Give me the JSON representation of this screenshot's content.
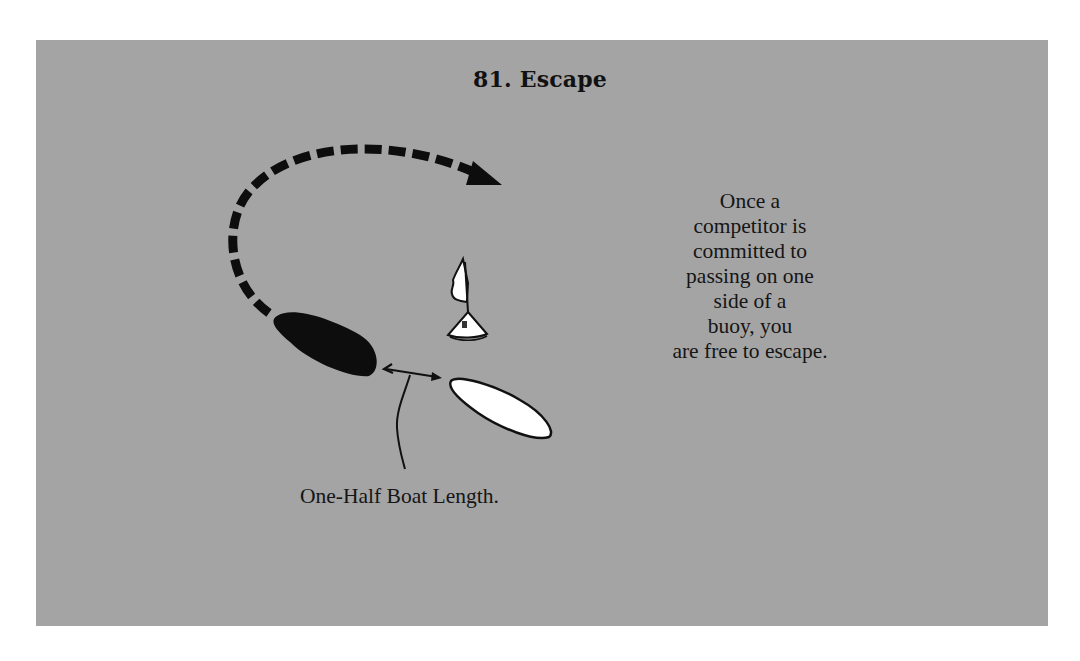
{
  "page": {
    "background_color": "#ffffff",
    "card_color": "#a4a4a4"
  },
  "title": "81.  Escape",
  "description": {
    "lines": [
      "Once a",
      "competitor is",
      "committed to",
      "passing on one",
      "side of a",
      "buoy, you",
      "are free to escape."
    ]
  },
  "diagram": {
    "caption": "One-Half Boat Length.",
    "elements": {
      "dark_boat": {
        "fill": "#0d0d0d"
      },
      "white_boat": {
        "fill": "#ffffff",
        "stroke": "#111111"
      },
      "buoy": {
        "fill": "#ffffff",
        "stroke": "#111111"
      },
      "escape_path": {
        "style": "dashed",
        "color": "#0d0d0d"
      },
      "distance_arrow": {
        "style": "double-headed",
        "color": "#111111"
      }
    }
  }
}
